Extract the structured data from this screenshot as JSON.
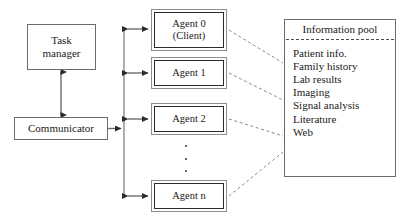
{
  "diagram": {
    "type": "block-diagram",
    "background_color": "#ffffff",
    "line_color": "#555555",
    "text_color": "#1a1a1a"
  },
  "nodes": {
    "task_manager": {
      "label_lines": [
        "Task",
        "manager"
      ],
      "line1": "Task",
      "line2": "manager",
      "x": 27,
      "y": 24,
      "w": 69,
      "h": 46,
      "style": "plain-box"
    },
    "communicator": {
      "label_lines": [
        "Communicator"
      ],
      "line1": "Communicator",
      "x": 14,
      "y": 117,
      "w": 94,
      "h": 23,
      "style": "plain-box"
    },
    "agent_0": {
      "label_lines": [
        "Agent 0",
        "(Client)"
      ],
      "line1": "Agent 0",
      "line2": "(Client)",
      "x": 151,
      "y": 9,
      "w": 76,
      "h": 42,
      "style": "agent-box"
    },
    "agent_1": {
      "label_lines": [
        "Agent 1"
      ],
      "line1": "Agent 1",
      "x": 151,
      "y": 57,
      "w": 76,
      "h": 32,
      "style": "agent-box"
    },
    "agent_2": {
      "label_lines": [
        "Agent 2"
      ],
      "line1": "Agent 2",
      "x": 151,
      "y": 103,
      "w": 76,
      "h": 32,
      "style": "agent-box"
    },
    "agent_n": {
      "label_lines": [
        "Agent n"
      ],
      "line1": "Agent n",
      "x": 151,
      "y": 180,
      "w": 76,
      "h": 32,
      "style": "agent-box"
    }
  },
  "ellipsis": {
    "symbol": "vertical-dots",
    "dot_count": 3,
    "x": 184,
    "y": 145,
    "w": 4,
    "h": 27
  },
  "information_pool": {
    "title": "Information pool",
    "x": 284,
    "y": 19,
    "w": 112,
    "h": 158,
    "items": [
      "Patient info.",
      "Family history",
      "Lab results",
      "Imaging",
      "Signal analysis",
      "Literature",
      "Web"
    ]
  },
  "connections": {
    "task_manager_to_communicator": {
      "kind": "double-arrow",
      "orientation": "vertical",
      "from": "task_manager",
      "to": "communicator"
    },
    "communicator_to_bus": {
      "kind": "single-arrow",
      "orientation": "horizontal",
      "from": "communicator",
      "to": "agent-bus"
    },
    "bus_to_agents": {
      "kind": "double-arrow",
      "orientation": "horizontal",
      "targets": [
        "agent_0",
        "agent_1",
        "agent_2",
        "agent_n"
      ]
    },
    "agents_to_information_pool": {
      "kind": "dashed-line",
      "sources": [
        "agent_0",
        "agent_1",
        "agent_2",
        "agent_n"
      ],
      "target": "information_pool"
    }
  }
}
